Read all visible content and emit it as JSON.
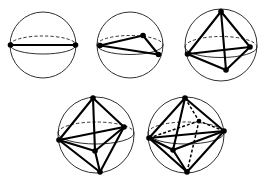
{
  "diagram": {
    "background_color": "#ffffff",
    "ink_color": "#000000",
    "sphere_outline_color": "#1a1a1a",
    "canvas": {
      "width": 270,
      "height": 182
    },
    "row_labels": [
      "top-row",
      "bottom-row"
    ],
    "figure_count": 5
  },
  "chart_data": {
    "type": "diagram",
    "figures": [
      {
        "id": "figure-1",
        "name": "two-point-antipodal",
        "label": "n = 2",
        "point_count": 2,
        "shape": "antipodal pair (digon)",
        "sphere": {
          "cx": 43,
          "cy": 45,
          "r": 33
        },
        "equator": {
          "cx": 43,
          "cy": 45,
          "rx": 33,
          "ry": 9
        },
        "vertices": [
          {
            "id": "v-left",
            "x": 10.5,
            "y": 45.0,
            "hidden": false
          },
          {
            "id": "v-right",
            "x": 75.5,
            "y": 45.0,
            "hidden": false
          }
        ],
        "edges_front": [
          [
            "v-left",
            "v-right"
          ]
        ],
        "edges_back": []
      },
      {
        "id": "figure-2",
        "name": "three-point-triangle",
        "label": "n = 3",
        "point_count": 3,
        "shape": "equilateral triangle on great circle",
        "sphere": {
          "cx": 130,
          "cy": 45,
          "r": 33
        },
        "equator": {
          "cx": 130,
          "cy": 45,
          "rx": 33,
          "ry": 9.5
        },
        "vertices": [
          {
            "id": "v-left",
            "x": 100.0,
            "y": 45.5,
            "hidden": false
          },
          {
            "id": "v-top",
            "x": 143.0,
            "y": 35.5,
            "hidden": false
          },
          {
            "id": "v-right",
            "x": 158.5,
            "y": 54.5,
            "hidden": false
          }
        ],
        "edges_front": [
          [
            "v-left",
            "v-top"
          ],
          [
            "v-top",
            "v-right"
          ],
          [
            "v-left",
            "v-right"
          ]
        ],
        "edges_back": []
      },
      {
        "id": "figure-3",
        "name": "four-point-tetrahedron",
        "label": "n = 4",
        "point_count": 4,
        "shape": "regular tetrahedron",
        "sphere": {
          "cx": 221,
          "cy": 45,
          "r": 36
        },
        "equator": {
          "cx": 221,
          "cy": 47,
          "rx": 36,
          "ry": 10.5
        },
        "vertices": [
          {
            "id": "v-apex",
            "x": 221.0,
            "y": 11.5,
            "hidden": false
          },
          {
            "id": "v-left",
            "x": 187.5,
            "y": 54.0,
            "hidden": false
          },
          {
            "id": "v-right",
            "x": 250.0,
            "y": 47.0,
            "hidden": false
          },
          {
            "id": "v-bottom",
            "x": 226.0,
            "y": 70.0,
            "hidden": false
          }
        ],
        "edges_front": [
          [
            "v-apex",
            "v-left"
          ],
          [
            "v-apex",
            "v-right"
          ],
          [
            "v-apex",
            "v-bottom"
          ],
          [
            "v-left",
            "v-bottom"
          ],
          [
            "v-right",
            "v-bottom"
          ],
          [
            "v-left",
            "v-right"
          ]
        ],
        "edges_back": []
      },
      {
        "id": "figure-4",
        "name": "five-point-bipyramid",
        "label": "n = 5",
        "point_count": 5,
        "shape": "triangular bipyramid",
        "sphere": {
          "cx": 96,
          "cy": 135,
          "r": 38
        },
        "equator": {
          "cx": 96,
          "cy": 133,
          "rx": 38,
          "ry": 11
        },
        "vertices": [
          {
            "id": "v-apex",
            "x": 93.0,
            "y": 98.0,
            "hidden": false
          },
          {
            "id": "v-bottom",
            "x": 100.0,
            "y": 172.0,
            "hidden": false
          },
          {
            "id": "v-left",
            "x": 59.0,
            "y": 140.0,
            "hidden": false
          },
          {
            "id": "v-right",
            "x": 124.0,
            "y": 127.0,
            "hidden": false
          },
          {
            "id": "v-front",
            "x": 95.0,
            "y": 151.0,
            "hidden": false
          }
        ],
        "edges_front": [
          [
            "v-apex",
            "v-left"
          ],
          [
            "v-apex",
            "v-right"
          ],
          [
            "v-apex",
            "v-front"
          ],
          [
            "v-bottom",
            "v-left"
          ],
          [
            "v-bottom",
            "v-right"
          ],
          [
            "v-bottom",
            "v-front"
          ],
          [
            "v-left",
            "v-front"
          ],
          [
            "v-right",
            "v-front"
          ],
          [
            "v-left",
            "v-right"
          ]
        ],
        "edges_back": []
      },
      {
        "id": "figure-5",
        "name": "six-point-octahedron",
        "label": "n = 6",
        "point_count": 6,
        "shape": "regular octahedron",
        "sphere": {
          "cx": 186,
          "cy": 135,
          "r": 38
        },
        "equator": {
          "cx": 186,
          "cy": 133,
          "rx": 38,
          "ry": 11
        },
        "vertices": [
          {
            "id": "v-apex",
            "x": 185.0,
            "y": 98.0,
            "hidden": false
          },
          {
            "id": "v-bottom",
            "x": 187.0,
            "y": 172.0,
            "hidden": false
          },
          {
            "id": "v-left",
            "x": 149.0,
            "y": 138.0,
            "hidden": false
          },
          {
            "id": "v-right",
            "x": 224.0,
            "y": 131.0,
            "hidden": false
          },
          {
            "id": "v-front",
            "x": 173.0,
            "y": 150.0,
            "hidden": false
          },
          {
            "id": "v-back",
            "x": 199.0,
            "y": 121.0,
            "hidden": true
          }
        ],
        "edges_front": [
          [
            "v-apex",
            "v-left"
          ],
          [
            "v-apex",
            "v-right"
          ],
          [
            "v-apex",
            "v-front"
          ],
          [
            "v-bottom",
            "v-left"
          ],
          [
            "v-bottom",
            "v-right"
          ],
          [
            "v-bottom",
            "v-front"
          ],
          [
            "v-left",
            "v-front"
          ],
          [
            "v-right",
            "v-front"
          ],
          [
            "v-left",
            "v-right"
          ]
        ],
        "edges_back": [
          [
            "v-apex",
            "v-back"
          ],
          [
            "v-bottom",
            "v-back"
          ],
          [
            "v-left",
            "v-back"
          ],
          [
            "v-right",
            "v-back"
          ]
        ]
      }
    ]
  }
}
